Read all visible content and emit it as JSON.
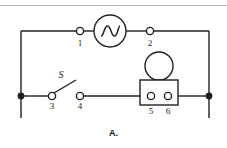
{
  "figure": {
    "caption": "A.",
    "type": "electrical-circuit-schematic",
    "line_color": "#231f20",
    "background_color": "#ffffff",
    "rule_color": "#b9b9b9"
  },
  "components": {
    "ac_source": {
      "name": "ac-voltage-source",
      "symbol": "circle-with-sine-wave",
      "center_x": 110,
      "center_y": 30,
      "radius": 16
    },
    "switch": {
      "name": "switch",
      "label": "S",
      "state": "open",
      "label_x": 60,
      "label_y": 76
    },
    "lamp": {
      "name": "lamp-in-socket",
      "symbol": "circle-on-rectangle",
      "bulb_center_x": 159,
      "bulb_center_y": 66,
      "bulb_radius": 14,
      "box_x": 140,
      "box_y": 80,
      "box_width": 38,
      "box_height": 25
    }
  },
  "terminals": [
    {
      "id": "1",
      "label": "1",
      "x": 80,
      "y": 31,
      "label_x": 80,
      "label_y": 38,
      "kind": "open-circle"
    },
    {
      "id": "2",
      "label": "2",
      "x": 150,
      "y": 31,
      "label_x": 150,
      "label_y": 38,
      "kind": "open-circle"
    },
    {
      "id": "3",
      "label": "3",
      "x": 52,
      "y": 96,
      "label_x": 52,
      "label_y": 103,
      "kind": "open-circle"
    },
    {
      "id": "4",
      "label": "4",
      "x": 80,
      "y": 96,
      "label_x": 80,
      "label_y": 103,
      "kind": "open-circle"
    },
    {
      "id": "5",
      "label": "5",
      "x": 151,
      "y": 96,
      "label_x": 151,
      "label_y": 108,
      "kind": "open-circle"
    },
    {
      "id": "6",
      "label": "6",
      "x": 168,
      "y": 96,
      "label_x": 168,
      "label_y": 108,
      "kind": "open-circle"
    }
  ],
  "junctions": [
    {
      "name": "left-node",
      "x": 21,
      "y": 96
    },
    {
      "name": "right-node",
      "x": 209,
      "y": 96
    }
  ],
  "rails": {
    "top_y": 31,
    "middle_y": 96,
    "left_x": 21,
    "right_x": 209,
    "stub_bottom_y": 118
  }
}
